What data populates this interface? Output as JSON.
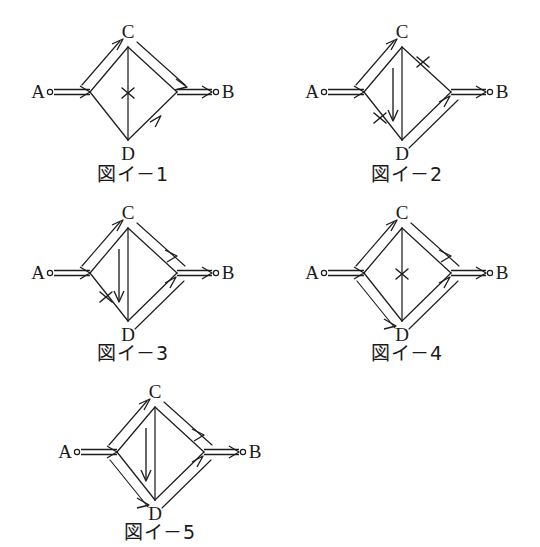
{
  "page": {
    "background_color": "#ffffff",
    "ink_color": "#1d1d1d",
    "width": 540,
    "height": 547
  },
  "figures": [
    {
      "id": "fig-i-1",
      "caption": "図イ－1",
      "nodes": [
        {
          "name": "A",
          "label": "A",
          "x": 25,
          "y": 70,
          "terminal": true
        },
        {
          "name": "C",
          "label": "C",
          "x": 110,
          "y": 18,
          "terminal": false
        },
        {
          "name": "D",
          "label": "D",
          "x": 110,
          "y": 122,
          "terminal": false
        },
        {
          "name": "B",
          "label": "B",
          "x": 195,
          "y": 70,
          "terminal": true
        }
      ],
      "edges": [
        {
          "from": "A",
          "to": "junction-left",
          "style": "double-arrow",
          "direction": "right"
        },
        {
          "from": "A",
          "to": "C",
          "style": "double-arrow",
          "direction": "to-C"
        },
        {
          "from": "C",
          "to": "B",
          "style": "double-arrow",
          "direction": "to-B"
        },
        {
          "from": "A",
          "to": "D",
          "style": "plain",
          "direction": "none"
        },
        {
          "from": "D",
          "to": "B",
          "style": "single-arrow",
          "direction": "to-B"
        },
        {
          "from": "C",
          "to": "D",
          "style": "plain-vertical",
          "direction": "none",
          "marker": "x"
        },
        {
          "from": "junction-right",
          "to": "B",
          "style": "double-arrow",
          "direction": "right"
        }
      ],
      "markers": [
        {
          "type": "x",
          "on": "C-D",
          "position": "middle"
        }
      ]
    },
    {
      "id": "fig-i-2",
      "caption": "図イ－2",
      "nodes": [
        {
          "name": "A",
          "label": "A",
          "x": 25,
          "y": 70,
          "terminal": true
        },
        {
          "name": "C",
          "label": "C",
          "x": 110,
          "y": 18,
          "terminal": false
        },
        {
          "name": "D",
          "label": "D",
          "x": 110,
          "y": 122,
          "terminal": false
        },
        {
          "name": "B",
          "label": "B",
          "x": 195,
          "y": 70,
          "terminal": true
        }
      ],
      "edges": [
        {
          "from": "A",
          "to": "junction-left",
          "style": "double-arrow",
          "direction": "right"
        },
        {
          "from": "A",
          "to": "C",
          "style": "double-arrow",
          "direction": "to-C"
        },
        {
          "from": "C",
          "to": "B",
          "style": "plain",
          "direction": "none",
          "marker": "x"
        },
        {
          "from": "A",
          "to": "D",
          "style": "plain",
          "direction": "none",
          "marker": "x"
        },
        {
          "from": "D",
          "to": "B",
          "style": "double-arrow",
          "direction": "to-B"
        },
        {
          "from": "C",
          "to": "D",
          "style": "vertical-arrow",
          "direction": "down"
        },
        {
          "from": "junction-right",
          "to": "B",
          "style": "double-arrow",
          "direction": "right"
        }
      ],
      "markers": [
        {
          "type": "x",
          "on": "C-B",
          "position": "upper"
        },
        {
          "type": "x",
          "on": "A-D",
          "position": "lower"
        }
      ]
    },
    {
      "id": "fig-i-3",
      "caption": "図イ－3",
      "nodes": [
        {
          "name": "A",
          "label": "A",
          "x": 25,
          "y": 70,
          "terminal": true
        },
        {
          "name": "C",
          "label": "C",
          "x": 110,
          "y": 18,
          "terminal": false
        },
        {
          "name": "D",
          "label": "D",
          "x": 110,
          "y": 122,
          "terminal": false
        },
        {
          "name": "B",
          "label": "B",
          "x": 195,
          "y": 70,
          "terminal": true
        }
      ],
      "edges": [
        {
          "from": "A",
          "to": "junction-left",
          "style": "double-arrow",
          "direction": "right"
        },
        {
          "from": "A",
          "to": "C",
          "style": "double-arrow",
          "direction": "to-C"
        },
        {
          "from": "C",
          "to": "B",
          "style": "double-arrow",
          "direction": "to-B"
        },
        {
          "from": "A",
          "to": "D",
          "style": "plain",
          "direction": "none",
          "marker": "x"
        },
        {
          "from": "D",
          "to": "B",
          "style": "double-arrow",
          "direction": "to-B"
        },
        {
          "from": "C",
          "to": "D",
          "style": "vertical-arrow",
          "direction": "down"
        },
        {
          "from": "junction-right",
          "to": "B",
          "style": "double-arrow",
          "direction": "right"
        }
      ],
      "markers": [
        {
          "type": "x",
          "on": "A-D",
          "position": "upper"
        }
      ]
    },
    {
      "id": "fig-i-4",
      "caption": "図イ－4",
      "nodes": [
        {
          "name": "A",
          "label": "A",
          "x": 25,
          "y": 70,
          "terminal": true
        },
        {
          "name": "C",
          "label": "C",
          "x": 110,
          "y": 18,
          "terminal": false
        },
        {
          "name": "D",
          "label": "D",
          "x": 110,
          "y": 122,
          "terminal": false
        },
        {
          "name": "B",
          "label": "B",
          "x": 195,
          "y": 70,
          "terminal": true
        }
      ],
      "edges": [
        {
          "from": "A",
          "to": "junction-left",
          "style": "double-arrow",
          "direction": "right"
        },
        {
          "from": "A",
          "to": "C",
          "style": "double-arrow",
          "direction": "to-C"
        },
        {
          "from": "C",
          "to": "B",
          "style": "double-arrow",
          "direction": "to-B"
        },
        {
          "from": "A",
          "to": "D",
          "style": "double-arrow",
          "direction": "to-D"
        },
        {
          "from": "D",
          "to": "B",
          "style": "double-arrow",
          "direction": "to-B"
        },
        {
          "from": "C",
          "to": "D",
          "style": "plain-vertical",
          "direction": "none",
          "marker": "x"
        },
        {
          "from": "junction-right",
          "to": "B",
          "style": "double-arrow",
          "direction": "right"
        }
      ],
      "markers": [
        {
          "type": "x",
          "on": "C-D",
          "position": "middle"
        }
      ]
    },
    {
      "id": "fig-i-5",
      "caption": "図イ－5",
      "nodes": [
        {
          "name": "A",
          "label": "A",
          "x": 25,
          "y": 70,
          "terminal": true
        },
        {
          "name": "C",
          "label": "C",
          "x": 110,
          "y": 18,
          "terminal": false
        },
        {
          "name": "D",
          "label": "D",
          "x": 110,
          "y": 122,
          "terminal": false
        },
        {
          "name": "B",
          "label": "B",
          "x": 195,
          "y": 70,
          "terminal": true
        }
      ],
      "edges": [
        {
          "from": "A",
          "to": "junction-left",
          "style": "double-arrow",
          "direction": "right"
        },
        {
          "from": "A",
          "to": "C",
          "style": "double-arrow",
          "direction": "to-C"
        },
        {
          "from": "C",
          "to": "B",
          "style": "double-arrow",
          "direction": "to-B"
        },
        {
          "from": "A",
          "to": "D",
          "style": "double-arrow",
          "direction": "to-D"
        },
        {
          "from": "D",
          "to": "B",
          "style": "double-arrow",
          "direction": "to-B"
        },
        {
          "from": "C",
          "to": "D",
          "style": "vertical-arrow",
          "direction": "down"
        },
        {
          "from": "junction-right",
          "to": "B",
          "style": "double-arrow",
          "direction": "right"
        }
      ],
      "markers": []
    }
  ],
  "labels": {
    "A": "A",
    "B": "B",
    "C": "C",
    "D": "D"
  }
}
